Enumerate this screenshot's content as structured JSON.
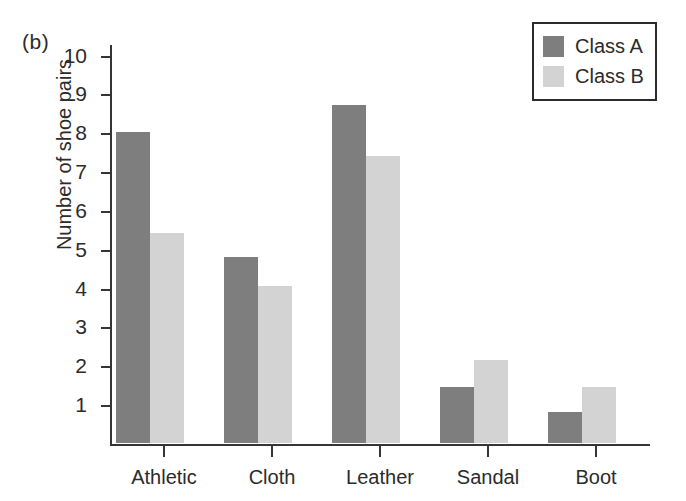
{
  "figure": {
    "panel_label": "(b)"
  },
  "legend": {
    "position": "top-right",
    "entries": [
      {
        "label": "Class A",
        "color": "#7e7e7e",
        "swatch_name": "legend-swatch-class-a"
      },
      {
        "label": "Class B",
        "color": "#d3d3d3",
        "swatch_name": "legend-swatch-class-b"
      }
    ]
  },
  "chart_data": {
    "type": "bar",
    "title": "",
    "subtitle": "",
    "xlabel": "",
    "ylabel": "Number of shoe pairs",
    "categories": [
      "Athletic",
      "Cloth",
      "Leather",
      "Sandal",
      "Boot"
    ],
    "series": [
      {
        "name": "Class A",
        "color": "#7e7e7e",
        "values": [
          8.0,
          4.8,
          8.7,
          1.45,
          0.8
        ]
      },
      {
        "name": "Class B",
        "color": "#d3d3d3",
        "values": [
          5.4,
          4.05,
          7.4,
          2.15,
          1.45
        ]
      }
    ],
    "ylim": [
      0,
      10.3
    ],
    "yticks": [
      1,
      2,
      3,
      4,
      5,
      6,
      7,
      8,
      9,
      10
    ],
    "ytick_labels": [
      "1",
      "2",
      "3",
      "4",
      "5",
      "6",
      "7",
      "8",
      "9",
      "10"
    ],
    "grid": false,
    "legend_position": "top-right"
  }
}
